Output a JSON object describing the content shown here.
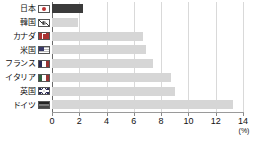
{
  "chart_data": {
    "type": "bar",
    "orientation": "horizontal",
    "title": "",
    "subtitle": "",
    "xlabel": "(%)",
    "ylabel": "",
    "xlim": [
      0,
      14
    ],
    "xticks": [
      0,
      2,
      4,
      6,
      8,
      10,
      12,
      14
    ],
    "xtick_labels": [
      "0",
      "2",
      "4",
      "6",
      "8",
      "10",
      "12",
      "14"
    ],
    "grid": true,
    "grid_axis": "x",
    "legend": "none",
    "categories": [
      "日本",
      "韓国",
      "カナダ",
      "米国",
      "フランス",
      "イタリア",
      "英国",
      "ドイツ"
    ],
    "values": [
      2.3,
      1.9,
      6.7,
      6.9,
      7.4,
      8.7,
      9.0,
      13.3
    ],
    "series": [
      {
        "name": "",
        "values": [
          2.3,
          1.9,
          6.7,
          6.9,
          7.4,
          8.7,
          9.0,
          13.3
        ]
      }
    ],
    "highlight_index": 0,
    "colors": {
      "bar": "#d6d6d6",
      "bar_highlight": "#3b3b3b",
      "gridline": "#d9d9d9",
      "axis": "#6b6b6b",
      "text": "#111111"
    },
    "flags": [
      "flag-jp",
      "flag-kr",
      "flag-ca",
      "flag-us",
      "flag-fr",
      "flag-it",
      "flag-gb",
      "flag-de"
    ],
    "unit": "(%)"
  },
  "footnote": {
    "text": ""
  }
}
